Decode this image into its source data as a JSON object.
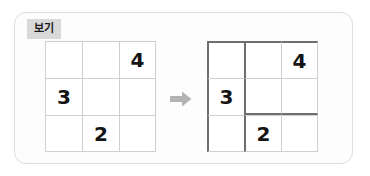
{
  "panel": {
    "tag_label": "보기",
    "tag_bg": "#d9d9d9",
    "border_color": "#dedede",
    "background": "#fdfdfd"
  },
  "arrow": {
    "icon": "arrow-right-icon",
    "color": "#b3b3b3",
    "direction": "right"
  },
  "colors": {
    "grid_line_light": "#cfcfcf",
    "grid_line_dark": "#6e6e6e",
    "digit_color": "#141414"
  },
  "figure": {
    "before": {
      "name": "before-grid",
      "rows": 3,
      "cols": 3,
      "cells": [
        {
          "row": 0,
          "col": 0,
          "value": ""
        },
        {
          "row": 0,
          "col": 1,
          "value": ""
        },
        {
          "row": 0,
          "col": 2,
          "value": "4"
        },
        {
          "row": 1,
          "col": 0,
          "value": "3"
        },
        {
          "row": 1,
          "col": 1,
          "value": ""
        },
        {
          "row": 1,
          "col": 2,
          "value": ""
        },
        {
          "row": 2,
          "col": 0,
          "value": ""
        },
        {
          "row": 2,
          "col": 1,
          "value": "2"
        },
        {
          "row": 2,
          "col": 2,
          "value": ""
        }
      ],
      "emphasis": []
    },
    "after": {
      "name": "after-grid",
      "rows": 3,
      "cols": 3,
      "cells": [
        {
          "row": 0,
          "col": 0,
          "value": ""
        },
        {
          "row": 0,
          "col": 1,
          "value": ""
        },
        {
          "row": 0,
          "col": 2,
          "value": "4"
        },
        {
          "row": 1,
          "col": 0,
          "value": "3"
        },
        {
          "row": 1,
          "col": 1,
          "value": ""
        },
        {
          "row": 1,
          "col": 2,
          "value": ""
        },
        {
          "row": 2,
          "col": 0,
          "value": ""
        },
        {
          "row": 2,
          "col": 1,
          "value": "2"
        },
        {
          "row": 2,
          "col": 2,
          "value": ""
        }
      ],
      "emphasis": [
        {
          "row": 0,
          "col": 0,
          "edges": [
            "top",
            "left"
          ]
        },
        {
          "row": 0,
          "col": 1,
          "edges": [
            "top",
            "left"
          ]
        },
        {
          "row": 0,
          "col": 2,
          "edges": [
            "top",
            "right"
          ]
        },
        {
          "row": 1,
          "col": 0,
          "edges": [
            "left"
          ]
        },
        {
          "row": 1,
          "col": 1,
          "edges": [
            "left",
            "bottom"
          ]
        },
        {
          "row": 1,
          "col": 2,
          "edges": [
            "right",
            "bottom"
          ]
        },
        {
          "row": 2,
          "col": 0,
          "edges": [
            "left",
            "bottom"
          ]
        },
        {
          "row": 2,
          "col": 1,
          "edges": [
            "left",
            "bottom"
          ]
        },
        {
          "row": 2,
          "col": 2,
          "edges": [
            "right",
            "bottom"
          ]
        }
      ]
    }
  }
}
